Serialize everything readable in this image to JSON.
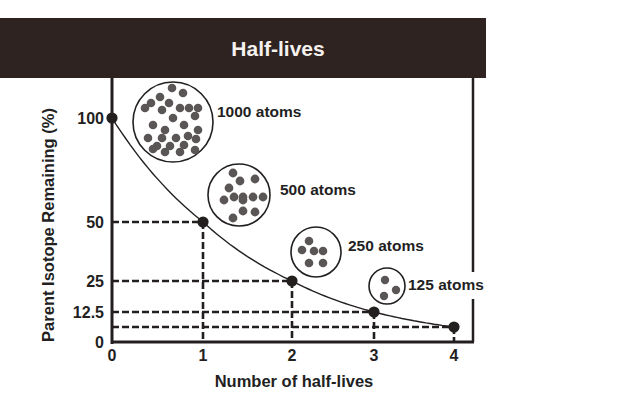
{
  "chart_data": {
    "type": "line",
    "title": "Half-lives",
    "xlabel": "Number of half-lives",
    "ylabel": "Parent Isotope Remaining (%)",
    "x_ticks": [
      "0",
      "1",
      "2",
      "3",
      "4"
    ],
    "y_ticks": [
      "0",
      "12.5",
      "25",
      "50",
      "100"
    ],
    "xlim": [
      0,
      4
    ],
    "ylim": [
      0,
      100
    ],
    "grid": false,
    "series": [
      {
        "name": "Parent isotope remaining",
        "x": [
          0,
          1,
          2,
          3,
          4
        ],
        "y": [
          100,
          50,
          25,
          12.5,
          6.25
        ]
      }
    ],
    "guide_lines": [
      {
        "x": 1,
        "y": 50
      },
      {
        "x": 2,
        "y": 25
      },
      {
        "x": 3,
        "y": 12.5
      },
      {
        "x": 4,
        "y": 6.25
      }
    ],
    "annotations": [
      {
        "label": "1000 atoms",
        "dots": 28
      },
      {
        "label": "500 atoms",
        "dots": 13
      },
      {
        "label": "250 atoms",
        "dots": 5
      },
      {
        "label": "125 atoms",
        "dots": 3
      }
    ],
    "colors": {
      "header": "#2e2320",
      "ink": "#231f1f",
      "atom": "#5a5655"
    }
  }
}
